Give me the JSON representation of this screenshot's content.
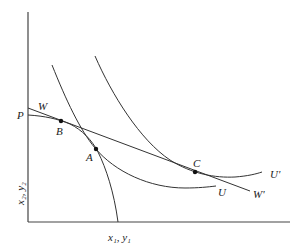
{
  "diagram": {
    "type": "economics-indifference-curve-diagram",
    "axes": {
      "x_label": "x₁, y₁",
      "y_label": "x₂, y₂"
    },
    "lines": {
      "budget_line_start": "W",
      "budget_line_end": "W'",
      "frontier_start": "P"
    },
    "curves": {
      "indifference_low": "U",
      "indifference_high": "U'"
    },
    "points": {
      "tangency_frontier_budget": "B",
      "tangency_frontier_U": "A",
      "tangency_budget_Uprime": "C"
    },
    "colors": {
      "stroke": "#333333",
      "background": "#ffffff"
    }
  }
}
